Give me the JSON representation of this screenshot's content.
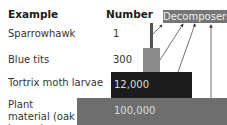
{
  "headers": {
    "example": "Example",
    "number": "Number"
  },
  "decomposers_label": "Decomposers",
  "rows": [
    {
      "example": "Sparrowhawk",
      "number": "1"
    },
    {
      "example": "Blue tits",
      "number": "300"
    },
    {
      "example": "Tortrix moth larvae",
      "number": "12,000"
    },
    {
      "example": "Plant material (oak leaves)",
      "number": "100,000"
    }
  ],
  "colors": {
    "sparrowhawk": "#555555",
    "blue_tits": "#8a8a8a",
    "larvae": "#1c1c1c",
    "plant": "#6e6e6e",
    "decomposers": "#767676"
  }
}
